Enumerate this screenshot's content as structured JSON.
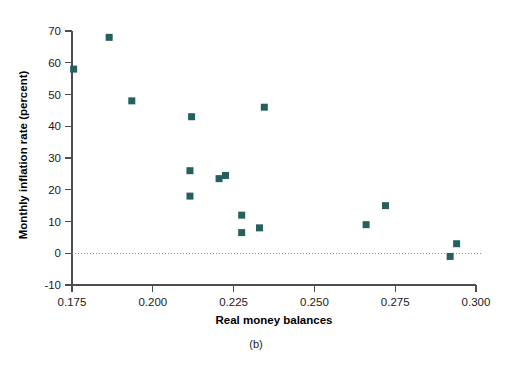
{
  "chart_data": {
    "type": "scatter",
    "title": "",
    "subtitle": "",
    "caption": "(b)",
    "xlabel": "Real money balances",
    "ylabel": "Monthly inflation rate (percent)",
    "xlim": [
      0.175,
      0.3
    ],
    "ylim": [
      -10,
      70
    ],
    "xticks": [
      0.175,
      0.2,
      0.225,
      0.25,
      0.275,
      0.3
    ],
    "xtick_labels": [
      "0.175",
      "0.200",
      "0.225",
      "0.250",
      "0.275",
      "0.300"
    ],
    "yticks": [
      -10,
      0,
      10,
      20,
      30,
      40,
      50,
      60,
      70
    ],
    "ytick_labels": [
      "-10",
      "0",
      "10",
      "20",
      "30",
      "40",
      "50",
      "60",
      "70"
    ],
    "grid": false,
    "legend": null,
    "zero_reference_line": 0,
    "marker": {
      "shape": "square",
      "color": "#256060",
      "size_px": 7
    },
    "series": [
      {
        "name": "Observations",
        "points": [
          {
            "x": 0.1755,
            "y": 58
          },
          {
            "x": 0.1865,
            "y": 68
          },
          {
            "x": 0.1935,
            "y": 48
          },
          {
            "x": 0.212,
            "y": 43
          },
          {
            "x": 0.2345,
            "y": 46
          },
          {
            "x": 0.2115,
            "y": 26
          },
          {
            "x": 0.2115,
            "y": 18
          },
          {
            "x": 0.2205,
            "y": 23.5
          },
          {
            "x": 0.2225,
            "y": 24.5
          },
          {
            "x": 0.2275,
            "y": 12
          },
          {
            "x": 0.2275,
            "y": 6.5
          },
          {
            "x": 0.233,
            "y": 8
          },
          {
            "x": 0.266,
            "y": 9
          },
          {
            "x": 0.272,
            "y": 15
          },
          {
            "x": 0.292,
            "y": -1
          },
          {
            "x": 0.294,
            "y": 3
          }
        ]
      }
    ]
  }
}
